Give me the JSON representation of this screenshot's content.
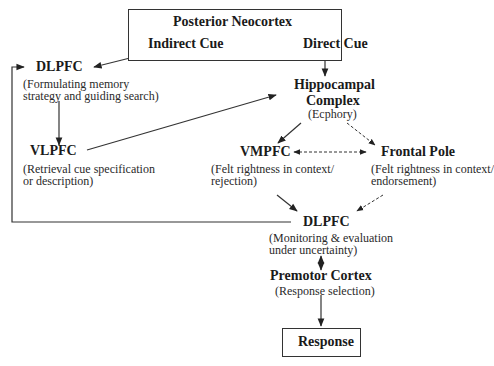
{
  "diagram": {
    "nodes": {
      "posterior_neocortex": {
        "title": "Posterior Neocortex",
        "indirect_cue": "Indirect Cue",
        "direct_cue": "Direct Cue"
      },
      "dlpfc_top": {
        "title": "DLPFC",
        "sub1": "(Formulating memory",
        "sub2": "strategy and guiding search)"
      },
      "hippocampal": {
        "title1": "Hippocampal",
        "title2": "Complex",
        "sub": "(Ecphory)"
      },
      "vlpfc": {
        "title": "VLPFC",
        "sub1": "(Retrieval cue specification",
        "sub2": "or description)"
      },
      "vmpfc": {
        "title": "VMPFC",
        "sub1": "(Felt rightness in context/",
        "sub2": "rejection)"
      },
      "frontal_pole": {
        "title": "Frontal Pole",
        "sub1": "(Felt rightness in context/",
        "sub2": "endorsement)"
      },
      "dlpfc_bottom": {
        "title": "DLPFC",
        "sub1": "(Monitoring & evaluation",
        "sub2": "under uncertainty)"
      },
      "premotor": {
        "title": "Premotor Cortex",
        "sub": "(Response selection)"
      },
      "response": {
        "title": "Response"
      }
    },
    "edges": [
      {
        "from": "Indirect Cue",
        "to": "DLPFC (top)",
        "style": "solid"
      },
      {
        "from": "Direct Cue",
        "to": "Hippocampal Complex",
        "style": "solid"
      },
      {
        "from": "DLPFC (top)",
        "to": "VLPFC",
        "style": "solid"
      },
      {
        "from": "VLPFC",
        "to": "Hippocampal Complex",
        "style": "solid"
      },
      {
        "from": "Hippocampal Complex",
        "to": "VMPFC",
        "style": "solid"
      },
      {
        "from": "Hippocampal Complex",
        "to": "Frontal Pole",
        "style": "dashed"
      },
      {
        "from": "VMPFC",
        "to": "Frontal Pole",
        "style": "dashed-bidirectional"
      },
      {
        "from": "VMPFC",
        "to": "DLPFC (bottom)",
        "style": "solid"
      },
      {
        "from": "Frontal Pole",
        "to": "DLPFC (bottom)",
        "style": "dashed"
      },
      {
        "from": "DLPFC (bottom)",
        "to": "DLPFC (top)",
        "style": "solid-feedback"
      },
      {
        "from": "DLPFC (bottom)",
        "to": "Premotor Cortex",
        "style": "solid-bidirectional"
      },
      {
        "from": "Premotor Cortex",
        "to": "Response",
        "style": "solid"
      }
    ]
  }
}
